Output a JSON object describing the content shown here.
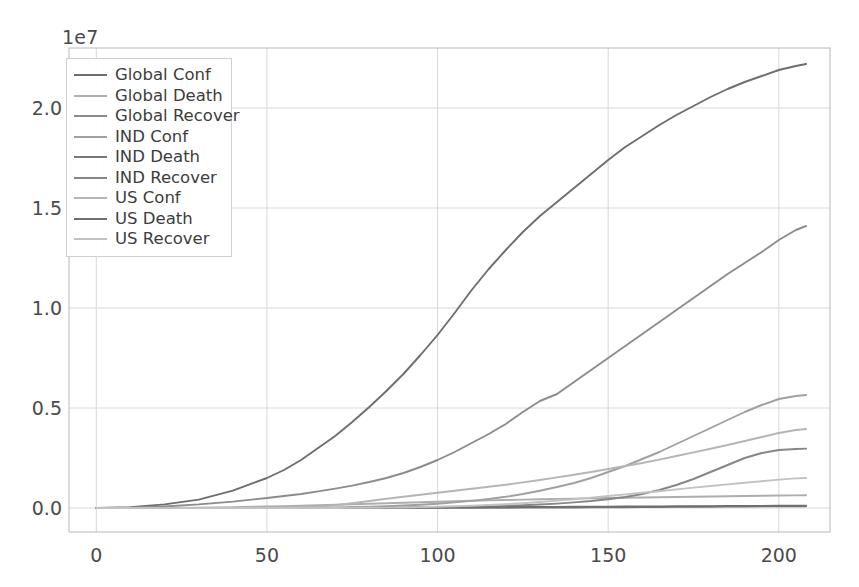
{
  "chart_data": {
    "type": "line",
    "title": "",
    "xlabel": "",
    "ylabel": "",
    "offset_text": "1e7",
    "y_offset_multiplier": 10000000,
    "xlim": [
      -8,
      215
    ],
    "ylim": [
      -1200000,
      23000000
    ],
    "xticks": [
      0,
      50,
      100,
      150,
      200
    ],
    "xtick_labels": [
      "0",
      "50",
      "100",
      "150",
      "200"
    ],
    "yticks": [
      0,
      5000000,
      10000000,
      15000000,
      20000000
    ],
    "ytick_labels": [
      "0.0",
      "0.5",
      "1.0",
      "1.5",
      "2.0"
    ],
    "grid": true,
    "legend_position": "upper left",
    "background_color": "#ffffff",
    "grid_color": "#d8d8d8",
    "axes_edge_color": "#b9b9b9",
    "x": [
      0,
      10,
      20,
      30,
      40,
      50,
      55,
      60,
      65,
      70,
      75,
      80,
      85,
      90,
      95,
      100,
      105,
      110,
      115,
      120,
      125,
      130,
      135,
      140,
      145,
      150,
      155,
      160,
      165,
      170,
      175,
      180,
      185,
      190,
      195,
      200,
      205,
      208
    ],
    "series": [
      {
        "name": "Global Conf",
        "color": "#6e6e6e",
        "values": [
          555,
          45000,
          180000,
          420000,
          870000,
          1500000,
          1900000,
          2400000,
          3000000,
          3600000,
          4300000,
          5050000,
          5850000,
          6700000,
          7650000,
          8650000,
          9750000,
          10900000,
          11950000,
          12900000,
          13800000,
          14600000,
          15300000,
          16000000,
          16700000,
          17400000,
          18050000,
          18600000,
          19150000,
          19650000,
          20100000,
          20550000,
          20950000,
          21300000,
          21600000,
          21900000,
          22100000,
          22200000
        ]
      },
      {
        "name": "Global Death",
        "color": "#adadad",
        "values": [
          17,
          1100,
          5500,
          15000,
          38000,
          75000,
          95000,
          115000,
          140000,
          165000,
          190000,
          215000,
          240000,
          265000,
          290000,
          315000,
          340000,
          360000,
          380000,
          400000,
          420000,
          438000,
          455000,
          470000,
          485000,
          500000,
          515000,
          528000,
          540000,
          552000,
          565000,
          578000,
          590000,
          602000,
          612000,
          622000,
          630000,
          634000
        ]
      },
      {
        "name": "Global Recover",
        "color": "#8c8c8c",
        "values": [
          28,
          12000,
          78000,
          180000,
          320000,
          500000,
          600000,
          700000,
          830000,
          970000,
          1120000,
          1300000,
          1500000,
          1750000,
          2050000,
          2400000,
          2800000,
          3250000,
          3700000,
          4200000,
          4800000,
          5350000,
          5700000,
          6300000,
          6900000,
          7500000,
          8100000,
          8700000,
          9300000,
          9900000,
          10500000,
          11100000,
          11700000,
          12250000,
          12800000,
          13400000,
          13900000,
          14100000
        ]
      },
      {
        "name": "IND Conf",
        "color": "#a0a0a0",
        "values": [
          0,
          3,
          30,
          280,
          1400,
          5000,
          8500,
          14000,
          22000,
          33000,
          48000,
          67000,
          92000,
          125000,
          165000,
          215000,
          280000,
          355000,
          450000,
          560000,
          700000,
          860000,
          1050000,
          1250000,
          1500000,
          1800000,
          2100000,
          2450000,
          2800000,
          3200000,
          3600000,
          4000000,
          4400000,
          4800000,
          5150000,
          5450000,
          5600000,
          5650000
        ]
      },
      {
        "name": "IND Death",
        "color": "#787878",
        "values": [
          0,
          0,
          1,
          5,
          35,
          150,
          280,
          450,
          700,
          1000,
          1500,
          2100,
          2800,
          3700,
          4700,
          6000,
          7700,
          9500,
          11500,
          14000,
          17000,
          20500,
          24500,
          28000,
          32000,
          36500,
          41000,
          46000,
          51000,
          56000,
          61000,
          66000,
          71000,
          76000,
          80500,
          85000,
          88000,
          89000
        ]
      },
      {
        "name": "IND Recover",
        "color": "#868686",
        "values": [
          0,
          0,
          5,
          25,
          120,
          480,
          870,
          1500,
          2500,
          3800,
          5800,
          8500,
          12000,
          17000,
          24000,
          33000,
          45000,
          60000,
          80000,
          105000,
          135000,
          175000,
          220000,
          280000,
          350000,
          440000,
          550000,
          700000,
          900000,
          1150000,
          1450000,
          1800000,
          2150000,
          2500000,
          2750000,
          2900000,
          2950000,
          2970000
        ]
      },
      {
        "name": "US Conf",
        "color": "#b5b5b5",
        "values": [
          0,
          0,
          2,
          8,
          60,
          1200,
          7000,
          25000,
          65000,
          140000,
          240000,
          350000,
          460000,
          560000,
          660000,
          760000,
          860000,
          960000,
          1060000,
          1160000,
          1280000,
          1400000,
          1530000,
          1660000,
          1800000,
          1950000,
          2100000,
          2250000,
          2420000,
          2600000,
          2780000,
          2960000,
          3150000,
          3350000,
          3550000,
          3750000,
          3900000,
          3950000
        ]
      },
      {
        "name": "US Death",
        "color": "#6f6f6f",
        "values": [
          0,
          0,
          0,
          0,
          1,
          30,
          110,
          400,
          1100,
          2600,
          5000,
          8500,
          13000,
          18000,
          23000,
          28000,
          33000,
          38000,
          42000,
          46000,
          50000,
          54000,
          58000,
          62000,
          66000,
          70000,
          74000,
          78000,
          82000,
          86000,
          90000,
          94000,
          98000,
          103000,
          108000,
          113000,
          118000,
          120000
        ]
      },
      {
        "name": "US Recover",
        "color": "#c2c2c2",
        "values": [
          0,
          0,
          0,
          0,
          0,
          5,
          30,
          150,
          500,
          1500,
          4000,
          9000,
          17000,
          28000,
          42000,
          60000,
          85000,
          115000,
          150000,
          190000,
          240000,
          300000,
          370000,
          440000,
          520000,
          600000,
          680000,
          760000,
          840000,
          930000,
          1020000,
          1100000,
          1180000,
          1260000,
          1340000,
          1420000,
          1480000,
          1500000
        ]
      }
    ]
  }
}
